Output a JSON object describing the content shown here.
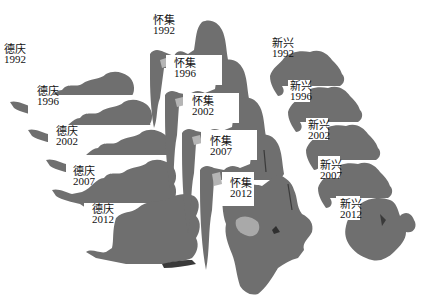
{
  "figure": {
    "colors": {
      "land": "#6f6f6f",
      "land_dark": "#4a4a4a",
      "urban": "#b5b5b5",
      "background": "#ffffff"
    },
    "groups": [
      {
        "county": "德庆",
        "panels": [
          {
            "name": "德庆",
            "year": "1992"
          },
          {
            "name": "德庆",
            "year": "1996"
          },
          {
            "name": "德庆",
            "year": "2002"
          },
          {
            "name": "德庆",
            "year": "2007"
          },
          {
            "name": "德庆",
            "year": "2012"
          }
        ]
      },
      {
        "county": "怀集",
        "panels": [
          {
            "name": "怀集",
            "year": "1992"
          },
          {
            "name": "怀集",
            "year": "1996"
          },
          {
            "name": "怀集",
            "year": "2002"
          },
          {
            "name": "怀集",
            "year": "2007"
          },
          {
            "name": "怀集",
            "year": "2012"
          }
        ]
      },
      {
        "county": "新兴",
        "panels": [
          {
            "name": "新兴",
            "year": "1992"
          },
          {
            "name": "新兴",
            "year": "1996"
          },
          {
            "name": "新兴",
            "year": "2002"
          },
          {
            "name": "新兴",
            "year": "2007"
          },
          {
            "name": "新兴",
            "year": "2012"
          }
        ]
      }
    ]
  }
}
